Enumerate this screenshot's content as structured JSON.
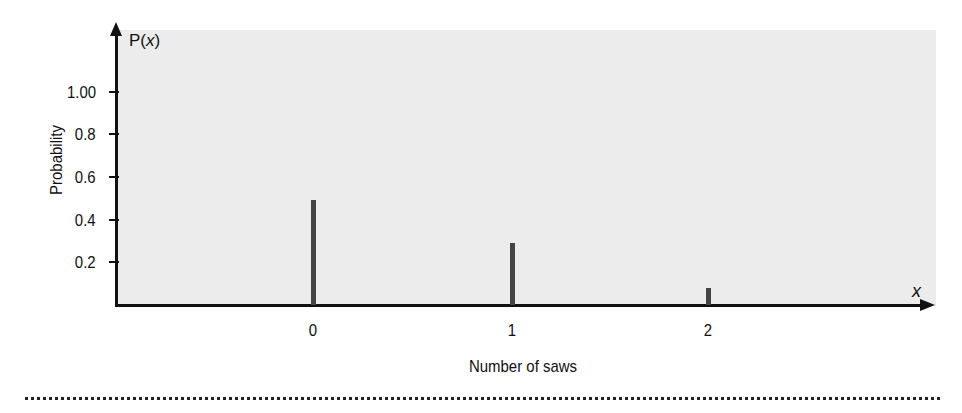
{
  "chart_data": {
    "type": "bar",
    "title": "",
    "xlabel": "Number of saws",
    "ylabel": "Probability",
    "y_axis_title": "P(x)",
    "x_axis_variable": "x",
    "categories": [
      "0",
      "1",
      "2"
    ],
    "values": [
      0.49,
      0.29,
      0.08
    ],
    "ylim": [
      0,
      1.1
    ],
    "y_ticks": [
      "0.2",
      "0.4",
      "0.6",
      "0.8",
      "1.00"
    ],
    "grid": false,
    "legend": null
  },
  "labels": {
    "p_prefix": "P(",
    "p_var": "x",
    "p_suffix": ")",
    "x_var": "x",
    "xlabel": "Number of saws",
    "ylabel": "Probability"
  }
}
